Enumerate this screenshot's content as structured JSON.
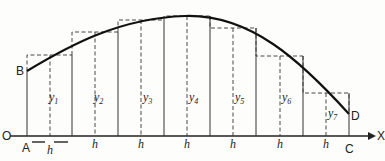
{
  "diagram": {
    "type": "midpoint-rectangle approximation of area under a curve",
    "axis": {
      "origin_label": "O",
      "x_axis_label": "X"
    },
    "points": {
      "B": "B",
      "D": "D",
      "A": "A",
      "C": "C"
    },
    "strip_width_label": "h",
    "strip_labels": [
      "h",
      "h",
      "h",
      "h",
      "h",
      "h",
      "h"
    ],
    "ordinates": [
      {
        "base": "y",
        "sub": "1"
      },
      {
        "base": "y",
        "sub": "2"
      },
      {
        "base": "y",
        "sub": "3"
      },
      {
        "base": "y",
        "sub": "4"
      },
      {
        "base": "y",
        "sub": "5"
      },
      {
        "base": "y",
        "sub": "6"
      },
      {
        "base": "y",
        "sub": "7"
      }
    ],
    "colors": {
      "ink": "#222222",
      "background": "#fdfdfb"
    }
  }
}
